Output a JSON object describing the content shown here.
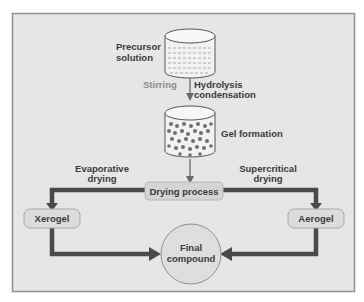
{
  "diagram": {
    "colors": {
      "background": "#ffffff",
      "frame_fill": "#e6e6e6",
      "frame_border": "#8f8f8f",
      "box_fill": "#d4d4d4",
      "box_border": "#a8a8a8",
      "arrow_thick": "#4a4a4a",
      "arrow_thin": "#6a6a6a",
      "text": "#3a3a3a",
      "text_light": "#8a8a8a",
      "particle": "#6e6e6e"
    },
    "nodes": {
      "precursor": {
        "label_line1": "Precursor",
        "label_line2": "solution"
      },
      "stirring": {
        "label": "Stirring"
      },
      "hydrolysis": {
        "label_line1": "Hydrolysis",
        "label_line2": "condensation"
      },
      "gel": {
        "label": "Gel formation"
      },
      "drying": {
        "label": "Drying process"
      },
      "evaporative": {
        "label_line1": "Evaporative",
        "label_line2": "drying"
      },
      "supercritical": {
        "label_line1": "Supercritical",
        "label_line2": "drying"
      },
      "xerogel": {
        "label": "Xerogel"
      },
      "aerogel": {
        "label": "Aerogel"
      },
      "final": {
        "label_line1": "Final",
        "label_line2": "compound"
      }
    },
    "edges": [
      {
        "from": "precursor",
        "to": "gel",
        "label": "Hydrolysis condensation"
      },
      {
        "from": "gel",
        "to": "drying"
      },
      {
        "from": "drying",
        "to": "xerogel",
        "label": "Evaporative drying"
      },
      {
        "from": "drying",
        "to": "aerogel",
        "label": "Supercritical drying"
      },
      {
        "from": "xerogel",
        "to": "final"
      },
      {
        "from": "aerogel",
        "to": "final"
      }
    ]
  }
}
